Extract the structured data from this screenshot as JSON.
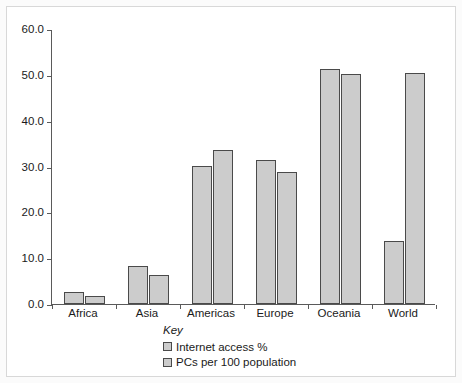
{
  "chart_data": {
    "type": "bar",
    "title": "",
    "xlabel": "",
    "ylabel": "",
    "ylim": [
      0,
      60
    ],
    "ytick_step": 10,
    "ytick_labels": [
      "0.0",
      "10.0",
      "20.0",
      "30.0",
      "40.0",
      "50.0",
      "60.0"
    ],
    "ytick_values": [
      0,
      10,
      20,
      30,
      40,
      50,
      60
    ],
    "grid": false,
    "legend_position": "below-axis-left-of-center",
    "legend_title": "Key",
    "categories": [
      "Africa",
      "Asia",
      "Americas",
      "Europe",
      "Oceania",
      "World"
    ],
    "series": [
      {
        "name": "Internet access %",
        "color": "#cccccc",
        "values": [
          2.6,
          8.3,
          30.1,
          31.4,
          51.2,
          13.7
        ]
      },
      {
        "name": "PCs per 100 population",
        "color": "#cccccc",
        "values": [
          1.7,
          6.3,
          33.6,
          28.8,
          50.2,
          50.3
        ]
      }
    ]
  },
  "colors": {
    "bar_fill": "#cccccc",
    "bar_border": "#4a4a4a",
    "axis": "#5a5a5a",
    "text": "#1a1a1a",
    "plot_background": "#ffffff",
    "page_background": "#fbfbfb"
  }
}
